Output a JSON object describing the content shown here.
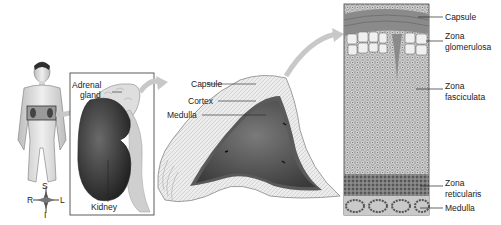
{
  "colors": {
    "ink": "#222222",
    "skin": "#e4e4e4",
    "kidney_dark": "#3a3a3a",
    "gland_light": "#dcdcdc",
    "medulla_dark": "#555555",
    "arrow": "#c8c8c8"
  },
  "figure_body": {
    "compass": {
      "superior": "S",
      "inferior": "I",
      "right": "R",
      "left": "L"
    }
  },
  "panel_kidney": {
    "labels": {
      "adrenal_gland_line1": "Adrenal",
      "adrenal_gland_line2": "gland",
      "kidney": "Kidney"
    }
  },
  "panel_gland": {
    "labels": {
      "capsule": "Capsule",
      "cortex": "Cortex",
      "medulla": "Medulla"
    }
  },
  "panel_histology": {
    "labels": [
      {
        "line1": "Capsule",
        "line2": ""
      },
      {
        "line1": "Zona",
        "line2": "glomerulosa"
      },
      {
        "line1": "Zona",
        "line2": "fasciculata"
      },
      {
        "line1": "Zona",
        "line2": "reticularis"
      },
      {
        "line1": "Medulla",
        "line2": ""
      }
    ]
  }
}
